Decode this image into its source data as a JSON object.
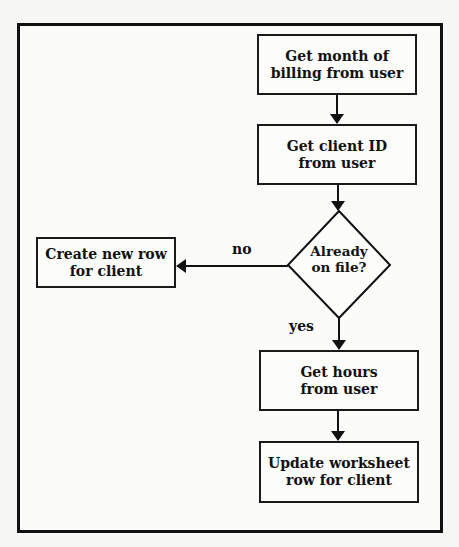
{
  "flowchart": {
    "nodes": {
      "get_month": {
        "label": "Get month of\nbilling from user",
        "shape": "rectangle"
      },
      "get_client_id": {
        "label": "Get client ID\nfrom user",
        "shape": "rectangle"
      },
      "already_on_file": {
        "label": "Already\non file?",
        "shape": "diamond"
      },
      "create_row": {
        "label": "Create new row\nfor client",
        "shape": "rectangle"
      },
      "get_hours": {
        "label": "Get hours\nfrom user",
        "shape": "rectangle"
      },
      "update_row": {
        "label": "Update worksheet\nrow for client",
        "shape": "rectangle"
      }
    },
    "edges": {
      "no_label": "no",
      "yes_label": "yes"
    },
    "edge_list": [
      {
        "from": "get_month",
        "to": "get_client_id",
        "label": ""
      },
      {
        "from": "get_client_id",
        "to": "already_on_file",
        "label": ""
      },
      {
        "from": "already_on_file",
        "to": "create_row",
        "label": "no"
      },
      {
        "from": "already_on_file",
        "to": "get_hours",
        "label": "yes"
      },
      {
        "from": "get_hours",
        "to": "update_row",
        "label": ""
      }
    ],
    "colors": {
      "stroke": "#111111",
      "background": "#fbfbfa"
    }
  }
}
